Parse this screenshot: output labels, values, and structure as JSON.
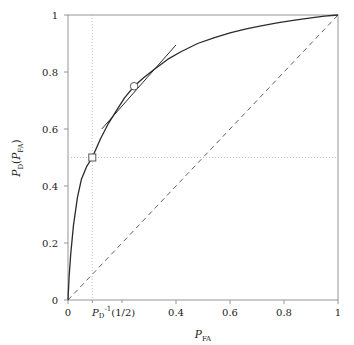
{
  "figure": {
    "background_color": "#ffffff",
    "frame_color": "#7a7a7a",
    "curve_color": "#2b2b2b",
    "grid_color": "#b9b9b9",
    "marker_fill": "#ffffff"
  },
  "axes": {
    "x": {
      "label_main": "P",
      "label_sub": "FA",
      "min": 0,
      "max": 1,
      "ticks": [
        0,
        0.2,
        0.4,
        0.6,
        0.8,
        1
      ],
      "tick_labels": [
        "0",
        "",
        "0.4",
        "0.6",
        "0.8",
        "1"
      ],
      "special_tick": {
        "value": 0.09,
        "text_p": "P",
        "text_sub": "D",
        "text_sup": "-1",
        "text_arg": "(1/2)"
      }
    },
    "y": {
      "label_p": "P",
      "label_sub": "D",
      "label_arg_open": "(",
      "label_arg_p": "P",
      "label_arg_sub": "FA",
      "label_arg_close": ")",
      "min": 0,
      "max": 1,
      "ticks": [
        0,
        0.2,
        0.4,
        0.6,
        0.8,
        1
      ],
      "tick_labels": [
        "0",
        "0.2",
        "0.4",
        "0.6",
        "0.8",
        "1"
      ]
    }
  },
  "chart_data": {
    "type": "line",
    "title": "",
    "xlabel": "P_FA",
    "ylabel": "P_D(P_FA)",
    "xlim": [
      0,
      1
    ],
    "ylim": [
      0,
      1
    ],
    "grid": false,
    "legend": "none",
    "series": [
      {
        "name": "ROC curve",
        "style": "solid",
        "color": "#2b2b2b",
        "x": [
          0,
          0.004,
          0.01,
          0.02,
          0.035,
          0.05,
          0.07,
          0.09,
          0.12,
          0.15,
          0.18,
          0.21,
          0.245,
          0.28,
          0.32,
          0.37,
          0.42,
          0.48,
          0.54,
          0.6,
          0.66,
          0.72,
          0.78,
          0.84,
          0.9,
          0.95,
          1
        ],
        "y": [
          0,
          0.08,
          0.16,
          0.26,
          0.36,
          0.425,
          0.47,
          0.5,
          0.565,
          0.62,
          0.665,
          0.71,
          0.75,
          0.78,
          0.81,
          0.845,
          0.872,
          0.9,
          0.92,
          0.937,
          0.951,
          0.963,
          0.973,
          0.982,
          0.99,
          0.996,
          1
        ]
      },
      {
        "name": "chance line",
        "style": "dashed",
        "color": "#4d4d4d",
        "x": [
          0,
          1
        ],
        "y": [
          0,
          1
        ]
      },
      {
        "name": "tangent line",
        "style": "solid",
        "color": "#2b2b2b",
        "x": [
          0.125,
          0.4
        ],
        "y": [
          0.6,
          0.895
        ]
      }
    ],
    "markers": [
      {
        "name": "half-detection-point",
        "shape": "square",
        "x": 0.09,
        "y": 0.5
      },
      {
        "name": "tangency-point",
        "shape": "circle",
        "x": 0.245,
        "y": 0.75
      }
    ],
    "guides": [
      {
        "name": "horizontal-guide",
        "style": "dotted",
        "orientation": "horizontal",
        "value": 0.5
      },
      {
        "name": "vertical-guide",
        "style": "dotted",
        "orientation": "vertical",
        "value": 0.09
      }
    ]
  }
}
